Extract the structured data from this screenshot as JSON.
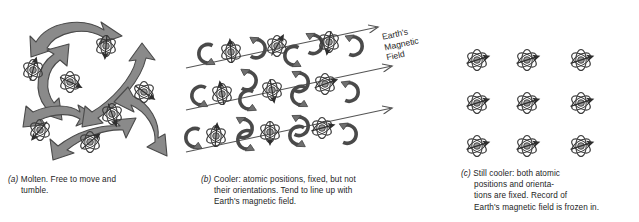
{
  "figure": {
    "background_color": "#ffffff"
  },
  "colors": {
    "arrow_fill": "#8a8a8a",
    "arrow_stroke": "#4a4a4a",
    "atom_stroke": "#3a3a3a",
    "nucleus_fill": "#9a9a9a",
    "field_line": "#555555",
    "text": "#1d1d1d"
  },
  "field_label": {
    "line1": "Earth's",
    "line2": "Magnetic",
    "line3": "Field"
  },
  "panels": [
    {
      "key": "a",
      "label": "(a)",
      "caption_line1": "Molten. Free to move and",
      "caption_line2": "tumble.",
      "state": "molten",
      "atom_count": 8,
      "atoms": [
        {
          "x": 33,
          "y": 70,
          "moment_deg": -75
        },
        {
          "x": 106,
          "y": 46,
          "moment_deg": 95
        },
        {
          "x": 70,
          "y": 82,
          "moment_deg": 25
        },
        {
          "x": 144,
          "y": 92,
          "moment_deg": 35
        },
        {
          "x": 112,
          "y": 114,
          "moment_deg": 70
        },
        {
          "x": 40,
          "y": 130,
          "moment_deg": 130
        },
        {
          "x": 90,
          "y": 142,
          "moment_deg": -40
        },
        {
          "x": 150,
          "y": 58,
          "moment_deg": 160
        }
      ]
    },
    {
      "key": "b",
      "label": "(b)",
      "caption_line1": "Cooler: atomic positions, fixed, but not",
      "caption_line2": "their orientations. Tend to line up with",
      "caption_line3": "Earth's magnetic field.",
      "state": "cooler",
      "atom_count": 9,
      "field_lines": 3,
      "field_line_angle_deg": -12,
      "atoms": [
        {
          "x": 231,
          "y": 52,
          "moment_deg": -95
        },
        {
          "x": 277,
          "y": 46,
          "moment_deg": -60
        },
        {
          "x": 329,
          "y": 42,
          "moment_deg": 100
        },
        {
          "x": 222,
          "y": 94,
          "moment_deg": -100
        },
        {
          "x": 272,
          "y": 90,
          "moment_deg": 80
        },
        {
          "x": 325,
          "y": 84,
          "moment_deg": -20
        },
        {
          "x": 216,
          "y": 136,
          "moment_deg": -85
        },
        {
          "x": 270,
          "y": 132,
          "moment_deg": 90
        },
        {
          "x": 322,
          "y": 128,
          "moment_deg": -15
        }
      ]
    },
    {
      "key": "c",
      "label": "(c)",
      "caption_line1": "Still cooler: both atomic",
      "caption_line2": "positions and orienta-",
      "caption_line3": "tions are fixed. Record of",
      "caption_line4": "Earth's magnetic field is frozen in.",
      "state": "still-cooler",
      "atom_count": 9,
      "grid_cols": 3,
      "grid_rows": 3,
      "uniform_moment_deg": -18,
      "atoms": [
        {
          "x": 477,
          "y": 60,
          "moment_deg": -18
        },
        {
          "x": 527,
          "y": 60,
          "moment_deg": -18
        },
        {
          "x": 581,
          "y": 60,
          "moment_deg": -18
        },
        {
          "x": 477,
          "y": 103,
          "moment_deg": -18
        },
        {
          "x": 527,
          "y": 103,
          "moment_deg": -18
        },
        {
          "x": 581,
          "y": 103,
          "moment_deg": -18
        },
        {
          "x": 477,
          "y": 146,
          "moment_deg": -18
        },
        {
          "x": 527,
          "y": 146,
          "moment_deg": -18
        },
        {
          "x": 581,
          "y": 146,
          "moment_deg": -18
        }
      ]
    }
  ]
}
